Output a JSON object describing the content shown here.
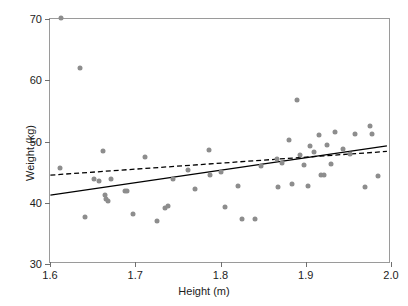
{
  "chart_data": {
    "type": "scatter",
    "title": "",
    "xlabel": "Height (m)",
    "ylabel": "Weight (kg)",
    "xlim": [
      1.6,
      2.0
    ],
    "ylim": [
      30,
      70
    ],
    "xticks": [
      "1.6",
      "1.7",
      "1.8",
      "1.9",
      "2.0"
    ],
    "xtick_values": [
      1.6,
      1.7,
      1.8,
      1.9,
      2.0
    ],
    "yticks": [
      "30",
      "40",
      "50",
      "60",
      "70"
    ],
    "ytick_values": [
      30,
      40,
      50,
      60,
      70
    ],
    "grid": false,
    "legend": "none",
    "point_color": "#8d8d8d",
    "line_color": "#000000",
    "frame_color": "#9a9a9a",
    "points": [
      {
        "x": 1.613,
        "y": 70.2
      },
      {
        "x": 1.635,
        "y": 62.0
      },
      {
        "x": 1.612,
        "y": 45.7
      },
      {
        "x": 1.641,
        "y": 37.6
      },
      {
        "x": 1.652,
        "y": 43.8
      },
      {
        "x": 1.657,
        "y": 43.6
      },
      {
        "x": 1.662,
        "y": 48.4
      },
      {
        "x": 1.664,
        "y": 41.3
      },
      {
        "x": 1.666,
        "y": 40.6
      },
      {
        "x": 1.668,
        "y": 40.3
      },
      {
        "x": 1.671,
        "y": 43.8
      },
      {
        "x": 1.688,
        "y": 42.0
      },
      {
        "x": 1.69,
        "y": 41.9
      },
      {
        "x": 1.697,
        "y": 38.1
      },
      {
        "x": 1.712,
        "y": 47.4
      },
      {
        "x": 1.725,
        "y": 37.0
      },
      {
        "x": 1.735,
        "y": 39.2
      },
      {
        "x": 1.738,
        "y": 39.5
      },
      {
        "x": 1.744,
        "y": 43.9
      },
      {
        "x": 1.762,
        "y": 45.3
      },
      {
        "x": 1.77,
        "y": 42.2
      },
      {
        "x": 1.786,
        "y": 48.6
      },
      {
        "x": 1.788,
        "y": 44.6
      },
      {
        "x": 1.8,
        "y": 45.0
      },
      {
        "x": 1.805,
        "y": 39.3
      },
      {
        "x": 1.82,
        "y": 42.8
      },
      {
        "x": 1.825,
        "y": 37.4
      },
      {
        "x": 1.84,
        "y": 37.3
      },
      {
        "x": 1.848,
        "y": 46.0
      },
      {
        "x": 1.866,
        "y": 47.2
      },
      {
        "x": 1.868,
        "y": 42.5
      },
      {
        "x": 1.872,
        "y": 46.5
      },
      {
        "x": 1.88,
        "y": 50.2
      },
      {
        "x": 1.884,
        "y": 43.1
      },
      {
        "x": 1.89,
        "y": 56.8
      },
      {
        "x": 1.893,
        "y": 47.8
      },
      {
        "x": 1.898,
        "y": 46.2
      },
      {
        "x": 1.903,
        "y": 42.7
      },
      {
        "x": 1.905,
        "y": 49.2
      },
      {
        "x": 1.91,
        "y": 48.3
      },
      {
        "x": 1.915,
        "y": 51.0
      },
      {
        "x": 1.918,
        "y": 44.6
      },
      {
        "x": 1.921,
        "y": 44.5
      },
      {
        "x": 1.925,
        "y": 49.5
      },
      {
        "x": 1.93,
        "y": 46.4
      },
      {
        "x": 1.934,
        "y": 51.6
      },
      {
        "x": 1.944,
        "y": 48.7
      },
      {
        "x": 1.952,
        "y": 47.9
      },
      {
        "x": 1.958,
        "y": 51.3
      },
      {
        "x": 1.97,
        "y": 42.6
      },
      {
        "x": 1.975,
        "y": 52.5
      },
      {
        "x": 1.978,
        "y": 51.2
      },
      {
        "x": 1.985,
        "y": 44.3
      }
    ],
    "lines": [
      {
        "name": "solid-fit-line",
        "style": "solid",
        "x0": 1.6,
        "y0": 41.0,
        "x1": 1.998,
        "y1": 49.1
      },
      {
        "name": "dashed-fit-line",
        "style": "dashed",
        "x0": 1.6,
        "y0": 44.3,
        "x1": 1.998,
        "y1": 48.2
      }
    ]
  }
}
